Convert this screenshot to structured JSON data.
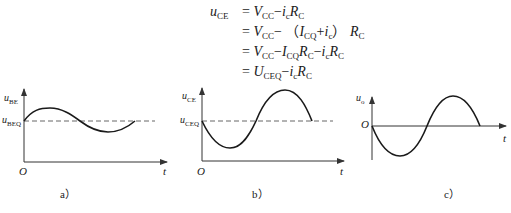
{
  "equations": {
    "lhs": "u",
    "lhs_sub": "CE",
    "lines": [
      {
        "parts": [
          [
            "V",
            "CC"
          ],
          [
            "-i",
            "c"
          ],
          [
            "R",
            "C"
          ]
        ],
        "text": "= V_CC − i_c R_C"
      },
      {
        "text": "= V_CC − (I_CQ + i_c) R_C"
      },
      {
        "text": "= V_CC − I_CQ R_C − i_c R_C"
      },
      {
        "text": "= U_CEQ − i_c R_C"
      }
    ]
  },
  "panels": [
    {
      "id": "a",
      "caption": "a）",
      "y_axis_label": "u",
      "y_axis_sub": "BE",
      "baseline_label": "u",
      "baseline_sub": "BEQ",
      "origin_label": "O",
      "x_axis_label": "t"
    },
    {
      "id": "b",
      "caption": "b）",
      "y_axis_label": "u",
      "y_axis_sub": "CE",
      "baseline_label": "u",
      "baseline_sub": "CEQ",
      "origin_label": "O",
      "x_axis_label": "t"
    },
    {
      "id": "c",
      "caption": "c）",
      "y_axis_label": "u",
      "y_axis_sub": "o",
      "origin_label": "O",
      "x_axis_label": "t"
    }
  ],
  "colors": {
    "ink": "#1a1a1a",
    "axis": "#333333",
    "dash": "#555555"
  }
}
